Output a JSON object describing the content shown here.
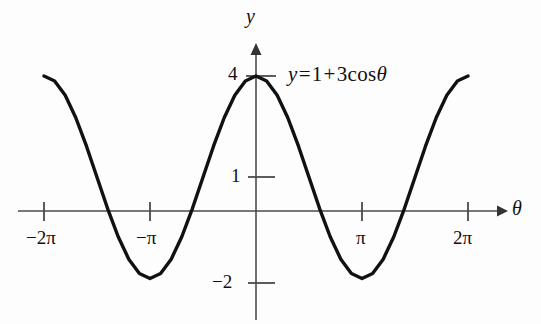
{
  "figure": {
    "kind": "cartesian-plot",
    "background_color": "#fdfdfd",
    "ink_color": "#111111",
    "axis_color": "#4a4a4a",
    "curve_color": "#111111",
    "equation": {
      "lhs": "y",
      "equals": "=",
      "term_constant": "1",
      "plus": "+",
      "coefficient": "3",
      "function": "cos",
      "argument": "θ",
      "full_text": "y = 1 + 3 cos θ"
    },
    "axes": {
      "x_axis_name": "θ",
      "y_axis_name": "y"
    }
  },
  "chart_data": {
    "type": "line",
    "title": "",
    "subtitle": "",
    "xlabel": "θ",
    "ylabel": "y",
    "equation": "y = 1 + 3 cos θ",
    "function": {
      "amplitude": 3,
      "vertical_shift": 1,
      "base": "cos",
      "period": 6.283185307179586
    },
    "grid": false,
    "legend": null,
    "xlim": [
      -7.6,
      7.9
    ],
    "ylim": [
      -2.9,
      4.8
    ],
    "x_domain_drawn": [
      -6.283185307179586,
      6.283185307179586
    ],
    "x_ticks": [
      -6.283185307179586,
      -3.141592653589793,
      3.141592653589793,
      6.283185307179586
    ],
    "x_tick_labels": [
      "−2π",
      "−π",
      "π",
      "2π"
    ],
    "y_ticks": [
      4,
      1,
      -2
    ],
    "y_tick_labels": [
      "4",
      "1",
      "−2"
    ],
    "key_points": [
      {
        "x": -6.283185307179586,
        "y": 4,
        "note": "maximum at -2π"
      },
      {
        "x": -3.141592653589793,
        "y": -2,
        "note": "minimum at -π"
      },
      {
        "x": 0,
        "y": 4,
        "note": "maximum at 0"
      },
      {
        "x": 3.141592653589793,
        "y": -2,
        "note": "minimum at π"
      },
      {
        "x": 6.283185307179586,
        "y": 4,
        "note": "maximum at 2π"
      }
    ],
    "x": [
      -6.283185307179586,
      -5.969026041820607,
      -5.654866776461628,
      -5.340707511102648,
      -5.026548245743669,
      -4.71238898038469,
      -4.39822971502571,
      -4.084070449666731,
      -3.7699111843077517,
      -3.455751918948772,
      -3.141592653589793,
      -2.827433388230814,
      -2.5132741228718345,
      -2.199114857512855,
      -1.8849555921538759,
      -1.5707963267948966,
      -1.2566370614359172,
      -0.9424777960769379,
      -0.6283185307179586,
      -0.3141592653589793,
      0,
      0.3141592653589793,
      0.6283185307179586,
      0.9424777960769379,
      1.2566370614359172,
      1.5707963267948966,
      1.8849555921538759,
      2.199114857512855,
      2.5132741228718345,
      2.827433388230814,
      3.141592653589793,
      3.455751918948772,
      3.7699111843077517,
      4.084070449666731,
      4.39822971502571,
      4.71238898038469,
      5.026548245743669,
      5.340707511102648,
      5.654866776461628,
      5.969026041820607,
      6.283185307179586
    ],
    "y": [
      4,
      3.854,
      3.427,
      2.763,
      1.927,
      1,
      0.073,
      -0.763,
      -1.427,
      -1.854,
      -2,
      -1.854,
      -1.427,
      -0.763,
      0.073,
      1,
      1.927,
      2.763,
      3.427,
      3.854,
      4,
      3.854,
      3.427,
      2.763,
      1.927,
      1,
      0.073,
      -0.763,
      -1.427,
      -1.854,
      -2,
      -1.854,
      -1.427,
      -0.763,
      0.073,
      1,
      1.927,
      2.763,
      3.427,
      3.854,
      4
    ]
  }
}
